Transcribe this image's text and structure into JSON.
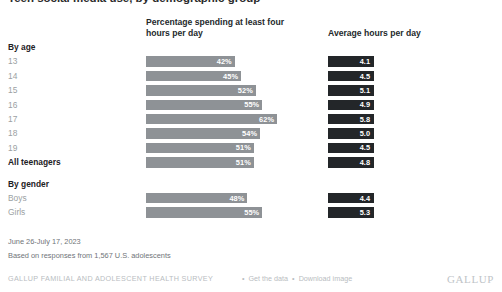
{
  "title": "Teen social media use, by demographic group",
  "headers": {
    "row_label_col": "",
    "percentage": "Percentage spending at least four hours per day",
    "average": "Average hours per day"
  },
  "chart_data": {
    "type": "bar",
    "title": "Teen social media use, by demographic group",
    "xlabel": "",
    "ylabel": "",
    "xlim": [
      0,
      70
    ],
    "grid": false,
    "legend": "none",
    "categories": [
      "13",
      "14",
      "15",
      "16",
      "17",
      "18",
      "19",
      "All teenagers",
      "Boys",
      "Girls"
    ],
    "groups": [
      {
        "label": "By age",
        "categories": [
          "13",
          "14",
          "15",
          "16",
          "17",
          "18",
          "19"
        ]
      },
      {
        "label": "By gender",
        "categories": [
          "Boys",
          "Girls"
        ]
      }
    ],
    "series": [
      {
        "name": "Percentage spending at least four hours per day",
        "unit": "%",
        "values": [
          42,
          45,
          52,
          55,
          62,
          54,
          51,
          51,
          48,
          55
        ]
      },
      {
        "name": "Average hours per day",
        "unit": "hours",
        "values": [
          4.1,
          4.5,
          5.1,
          4.9,
          5.8,
          5.0,
          4.5,
          4.8,
          4.4,
          5.3
        ]
      }
    ]
  },
  "rows": [
    {
      "kind": "group",
      "label": "By age"
    },
    {
      "kind": "data",
      "label": "13",
      "pct": 42,
      "pct_text": "42%",
      "avg_text": "4.1"
    },
    {
      "kind": "data",
      "label": "14",
      "pct": 45,
      "pct_text": "45%",
      "avg_text": "4.5"
    },
    {
      "kind": "data",
      "label": "15",
      "pct": 52,
      "pct_text": "52%",
      "avg_text": "5.1"
    },
    {
      "kind": "data",
      "label": "16",
      "pct": 55,
      "pct_text": "55%",
      "avg_text": "4.9"
    },
    {
      "kind": "data",
      "label": "17",
      "pct": 62,
      "pct_text": "62%",
      "avg_text": "5.8"
    },
    {
      "kind": "data",
      "label": "18",
      "pct": 54,
      "pct_text": "54%",
      "avg_text": "5.0"
    },
    {
      "kind": "data",
      "label": "19",
      "pct": 51,
      "pct_text": "51%",
      "avg_text": "4.5"
    },
    {
      "kind": "total",
      "label": "All teenagers",
      "pct": 51,
      "pct_text": "51%",
      "avg_text": "4.8"
    },
    {
      "kind": "group",
      "label": "By gender"
    },
    {
      "kind": "data",
      "label": "Boys",
      "pct": 48,
      "pct_text": "48%",
      "avg_text": "4.4"
    },
    {
      "kind": "data",
      "label": "Girls",
      "pct": 55,
      "pct_text": "55%",
      "avg_text": "5.3"
    }
  ],
  "footnotes": {
    "dates": "June 26-July 17, 2023",
    "sample": "Based on responses from 1,567 U.S. adolescents"
  },
  "source": {
    "survey": "GALLUP FAMILIAL AND ADOLESCENT HEALTH SURVEY",
    "separator": "•",
    "get_data_label": "Get the data",
    "download_label": "Download image",
    "logo": "GALLUP"
  },
  "colors": {
    "bar": "#8e9296",
    "chip": "#232629",
    "label_muted": "#9b9fa3",
    "label_strong": "#1d2124",
    "footnote": "#6f7478",
    "source": "#b9bdc1",
    "background": "#ffffff"
  }
}
